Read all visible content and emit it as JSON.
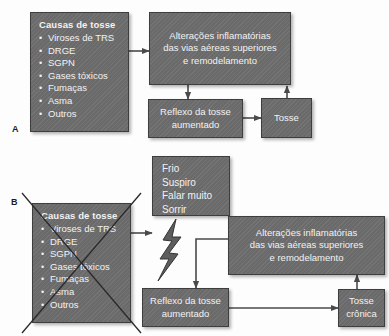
{
  "figure": {
    "type": "flowchart",
    "language": "pt-BR",
    "panels": [
      "A",
      "B"
    ]
  },
  "colors": {
    "box_fill": "#6e6e6e",
    "box_border": "#3e3e3e",
    "box_text": "#f2f2f2",
    "connector": "#4a4a4a",
    "background": "#fdfdfd",
    "label_text": "#1d1d1d"
  },
  "panel_a": {
    "label": "A",
    "causes_box": {
      "title": "Causas de tosse",
      "bullet_glyph": "•",
      "items": [
        "Viroses de TRS",
        "DRGE",
        "SGPN",
        "Gases tóxicos",
        "Fumaças",
        "Asma",
        "Outros"
      ]
    },
    "inflammation_box": {
      "line1": "Alterações inflamatórias",
      "line2": "das vias aéreas superiores",
      "line3": "e remodelamento"
    },
    "reflex_box": {
      "line1": "Reflexo da tosse",
      "line2": "aumentado"
    },
    "cough_box": {
      "line1": "Tosse"
    }
  },
  "panel_b": {
    "label": "B",
    "causes_box": {
      "title": "Causas de tosse",
      "bullet_glyph": "•",
      "crossed_out": true,
      "items": [
        "Viroses de TRS",
        "DRGE",
        "SGPN",
        "Gases tóxicos",
        "Fumaças",
        "Asma",
        "Outros"
      ]
    },
    "triggers_box": {
      "line1": "Frio",
      "line2": "Suspiro",
      "line3": "Falar muito",
      "line4": "Sorrir"
    },
    "bolt_icon": "lightning-bolt-icon",
    "inflammation_box": {
      "line1": "Alterações inflamatórias",
      "line2": "das vias aéreas superiores",
      "line3": "e remodelamento"
    },
    "reflex_box": {
      "line1": "Reflexo da tosse",
      "line2": "aumentado"
    },
    "chronic_cough_box": {
      "line1": "Tosse",
      "line2": "crônica"
    }
  }
}
